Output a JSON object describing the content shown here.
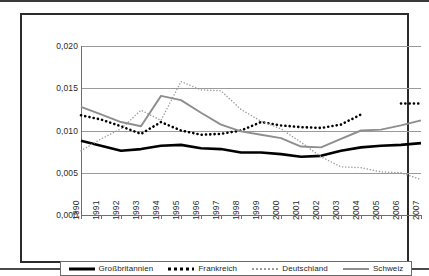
{
  "chart_data": {
    "type": "line",
    "title": "",
    "subtitle": "",
    "xlabel": "",
    "ylabel": "",
    "grid": true,
    "legend_position": "bottom",
    "categories": [
      "1990",
      "1991",
      "1992",
      "1993",
      "1994",
      "1995",
      "1996",
      "1997",
      "1998",
      "1999",
      "2000",
      "2001",
      "2002",
      "2003",
      "2004",
      "2005",
      "2006",
      "2007"
    ],
    "ylim": [
      0.0,
      0.02
    ],
    "yticks": [
      0.0,
      0.005,
      0.01,
      0.015,
      0.02
    ],
    "ytick_labels": [
      "0,000",
      "0,005",
      "0,010",
      "0,015",
      "0,020"
    ],
    "series": [
      {
        "name": "Großbritannien",
        "color": "#000000",
        "style": "solid-thick",
        "values": [
          0.0088,
          0.0082,
          0.0076,
          0.0078,
          0.0082,
          0.0083,
          0.0079,
          0.0078,
          0.0074,
          0.0074,
          0.0072,
          0.0069,
          0.007,
          0.0076,
          0.008,
          0.0082,
          0.0083,
          0.0085
        ]
      },
      {
        "name": "Frankreich",
        "color": "#000000",
        "style": "dotted-bold",
        "values": [
          0.0118,
          0.0113,
          0.0105,
          0.0096,
          0.011,
          0.01,
          0.0095,
          0.0096,
          0.01,
          0.011,
          0.0106,
          0.0104,
          0.0103,
          0.0107,
          0.0119,
          null,
          0.0132,
          0.0132
        ]
      },
      {
        "name": "Deutschland",
        "color": "#9d9d9d",
        "style": "dotted-fine",
        "values": [
          0.0076,
          0.009,
          0.0102,
          0.0124,
          0.0112,
          0.0158,
          0.0148,
          0.0147,
          0.0125,
          0.0111,
          0.0102,
          0.0086,
          0.0069,
          0.0057,
          0.0056,
          0.0051,
          0.005,
          0.0042
        ]
      },
      {
        "name": "Schweiz",
        "color": "#8e8e8e",
        "style": "solid-gray",
        "values": [
          0.0128,
          0.0119,
          0.011,
          0.0105,
          0.0141,
          0.0136,
          0.0121,
          0.0107,
          0.0099,
          0.0095,
          0.0091,
          0.0081,
          0.008,
          0.009,
          0.01,
          0.0101,
          0.0106,
          0.0112
        ]
      }
    ]
  },
  "legend": {
    "items": [
      {
        "label": "Großbritannien",
        "swatch": "solid-thick-black"
      },
      {
        "label": "Frankreich",
        "swatch": "dotted-bold-black"
      },
      {
        "label": "Deutschland",
        "swatch": "dotted-fine-gray"
      },
      {
        "label": "Schweiz",
        "swatch": "solid-gray"
      }
    ]
  }
}
